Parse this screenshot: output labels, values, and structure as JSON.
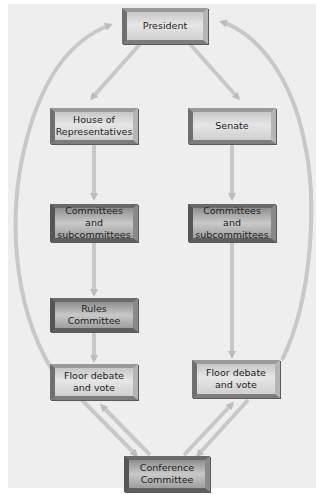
{
  "diagram": {
    "nodes": [
      {
        "id": "president",
        "label": "President"
      },
      {
        "id": "house",
        "label": "House of\nRepresentatives"
      },
      {
        "id": "senate",
        "label": "Senate"
      },
      {
        "id": "house_committees",
        "label": "Committees and\nsubcommittees"
      },
      {
        "id": "senate_committees",
        "label": "Committees and\nsubcommittees"
      },
      {
        "id": "rules",
        "label": "Rules Committee"
      },
      {
        "id": "house_floor",
        "label": "Floor debate\nand vote"
      },
      {
        "id": "senate_floor",
        "label": "Floor debate\nand vote"
      },
      {
        "id": "conference",
        "label": "Conference\nCommittee"
      }
    ],
    "edges": [
      {
        "from": "president",
        "to": "house"
      },
      {
        "from": "president",
        "to": "senate"
      },
      {
        "from": "house",
        "to": "house_committees"
      },
      {
        "from": "house_committees",
        "to": "rules"
      },
      {
        "from": "rules",
        "to": "house_floor"
      },
      {
        "from": "senate",
        "to": "senate_committees"
      },
      {
        "from": "senate_committees",
        "to": "senate_floor"
      },
      {
        "from": "house_floor",
        "to": "president"
      },
      {
        "from": "senate_floor",
        "to": "president"
      },
      {
        "from": "house_floor",
        "to": "conference"
      },
      {
        "from": "conference",
        "to": "house_floor"
      },
      {
        "from": "senate_floor",
        "to": "conference"
      },
      {
        "from": "conference",
        "to": "senate_floor"
      }
    ],
    "colors": {
      "background": "#eeeeee",
      "arrow": "#c4c4c4",
      "box_face": "#dcdcdc",
      "box_bevel": "#777777",
      "text": "#222222"
    }
  }
}
